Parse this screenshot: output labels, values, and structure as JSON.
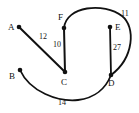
{
  "figure": {
    "type": "weighted-graph-diagram",
    "width": 139,
    "height": 113,
    "background_color": "#ffffff",
    "stroke_color": "#111111",
    "node_color": "#111111"
  },
  "nodes": [
    {
      "id": "A",
      "label": "A",
      "x": 19,
      "y": 27,
      "label_x": 8,
      "label_y": 23,
      "r": 2.3
    },
    {
      "id": "B",
      "label": "B",
      "x": 20,
      "y": 70,
      "label_x": 9,
      "label_y": 72,
      "r": 2.3
    },
    {
      "id": "C",
      "label": "C",
      "x": 65,
      "y": 72,
      "label_x": 61,
      "label_y": 78,
      "r": 2.3
    },
    {
      "id": "D",
      "label": "D",
      "x": 111,
      "y": 75,
      "label_x": 108,
      "label_y": 79,
      "r": 2.3
    },
    {
      "id": "E",
      "label": "E",
      "x": 110,
      "y": 27,
      "label_x": 115,
      "label_y": 23,
      "r": 2.3
    },
    {
      "id": "F",
      "label": "F",
      "x": 64,
      "y": 28,
      "label_x": 58,
      "label_y": 13,
      "r": 2.3
    }
  ],
  "edges": [
    {
      "id": "A-C",
      "from": "A",
      "to": "C",
      "weight": "12",
      "shape": "line",
      "path": "M 19 27 L 65 72",
      "label_x": 39,
      "label_y": 33,
      "width": 2.0
    },
    {
      "id": "F-C",
      "from": "F",
      "to": "C",
      "weight": "10",
      "shape": "line",
      "path": "M 64 28 L 65 72",
      "label_x": 53,
      "label_y": 41,
      "width": 2.0
    },
    {
      "id": "E-D",
      "from": "E",
      "to": "D",
      "weight": "27",
      "shape": "line",
      "path": "M 110 27 L 111 75",
      "label_x": 113,
      "label_y": 44,
      "width": 1.8
    },
    {
      "id": "F-D",
      "from": "F",
      "to": "D",
      "weight": "11",
      "shape": "arc",
      "path": "M 64 28 C 66 6 104 2 122 16 C 136 27 134 58 111 75",
      "label_x": 121,
      "label_y": 10,
      "width": 1.8
    },
    {
      "id": "B-D",
      "from": "B",
      "to": "D",
      "weight": "14",
      "shape": "arc",
      "path": "M 20 70 C 30 92 58 102 78 100 C 95 98 106 88 111 75",
      "label_x": 58,
      "label_y": 99,
      "width": 1.8
    }
  ]
}
